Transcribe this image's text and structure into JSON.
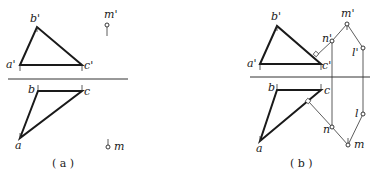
{
  "figures": [
    {
      "id": "a",
      "caption": "( a )",
      "axis": {
        "x1": 8,
        "x2": 128,
        "y": 79
      },
      "front_view": {
        "triangle": {
          "a": [
            20,
            65
          ],
          "b": [
            37,
            27
          ],
          "c": [
            82,
            65
          ]
        },
        "labels": {
          "a": "a'",
          "b": "b'",
          "c": "c'"
        },
        "point_m": {
          "pos": [
            107,
            25
          ],
          "label": "m'"
        }
      },
      "top_view": {
        "triangle": {
          "a": [
            20,
            138
          ],
          "b": [
            38,
            91
          ],
          "c": [
            82,
            91
          ]
        },
        "labels": {
          "a": "a",
          "b": "b",
          "c": "c"
        },
        "point_m": {
          "pos": [
            108,
            147
          ],
          "label": "m"
        }
      }
    },
    {
      "id": "b",
      "caption": "( b )",
      "axis": {
        "x1": 250,
        "x2": 370,
        "y": 77
      },
      "front_view": {
        "triangle": {
          "a": [
            260,
            64
          ],
          "b": [
            277,
            26
          ],
          "c": [
            321,
            64
          ]
        },
        "labels": {
          "a": "a'",
          "b": "b'",
          "c": "c'",
          "m": "m'",
          "n": "n'",
          "l": "l'"
        },
        "points": {
          "m": [
            347,
            24
          ],
          "n": [
            332,
            41
          ],
          "l": [
            363,
            48
          ]
        }
      },
      "top_view": {
        "triangle": {
          "a": [
            260,
            141
          ],
          "b": [
            277,
            90
          ],
          "c": [
            321,
            90
          ]
        },
        "labels": {
          "a": "a",
          "b": "b",
          "c": "c",
          "m": "m",
          "n": "n",
          "l": "l"
        },
        "points": {
          "m": [
            348,
            145
          ],
          "n": [
            332,
            127
          ],
          "l": [
            363,
            114
          ]
        }
      }
    }
  ]
}
